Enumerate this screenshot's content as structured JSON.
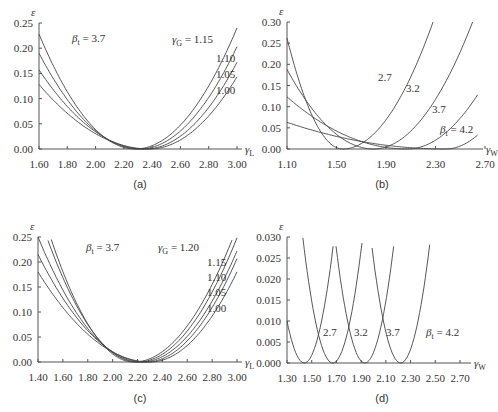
{
  "chart_data": [
    {
      "panel": "a",
      "caption": "(a)",
      "type": "line",
      "xlabel": "γL",
      "ylabel": "ε",
      "xlim": [
        1.6,
        3.0
      ],
      "ylim": [
        0.0,
        0.25
      ],
      "xticks": [
        "1.60",
        "1.80",
        "2.00",
        "2.20",
        "2.40",
        "2.60",
        "2.80",
        "3.00"
      ],
      "yticks": [
        "0.00",
        "0.05",
        "0.10",
        "0.15",
        "0.20",
        "0.25"
      ],
      "annotations": [
        "βt = 3.7",
        "γG = 1.15",
        "1.10",
        "1.05",
        "1.00"
      ],
      "series": [
        {
          "name": "γG = 1.15",
          "min_x": 2.28,
          "y_at_xmin": 0.228,
          "y_at_xmax": 0.24
        },
        {
          "name": "γG = 1.10",
          "min_x": 2.31,
          "y_at_xmin": 0.19,
          "y_at_xmax": 0.203
        },
        {
          "name": "γG = 1.05",
          "min_x": 2.35,
          "y_at_xmin": 0.157,
          "y_at_xmax": 0.172
        },
        {
          "name": "γG = 1.00",
          "min_x": 2.38,
          "y_at_xmin": 0.128,
          "y_at_xmax": 0.143
        }
      ]
    },
    {
      "panel": "b",
      "caption": "(b)",
      "type": "line",
      "xlabel": "γW",
      "ylabel": "ε",
      "xlim": [
        1.1,
        2.7
      ],
      "ylim": [
        0.0,
        0.3
      ],
      "xticks": [
        "1.10",
        "1.50",
        "1.90",
        "2.30",
        "2.70"
      ],
      "yticks": [
        "0.00",
        "0.05",
        "0.10",
        "0.15",
        "0.20",
        "0.25",
        "0.30"
      ],
      "annotations": [
        "2.7",
        "3.2",
        "3.7",
        "βt = 4.2"
      ],
      "series": [
        {
          "name": "βt = 2.7",
          "min_x": 1.55,
          "y_at_1.10": 0.262,
          "end_x": 2.28,
          "end_y": 0.3
        },
        {
          "name": "βt = 3.2",
          "min_x": 1.8,
          "y_at_1.10": 0.188,
          "end_x": 2.6,
          "end_y": 0.3
        },
        {
          "name": "βt = 3.7",
          "min_x": 2.07,
          "y_at_1.10": 0.123,
          "end_x": 2.64,
          "end_y": 0.128
        },
        {
          "name": "βt = 4.2",
          "min_x": 2.38,
          "y_at_1.10": 0.063,
          "end_x": 2.64,
          "end_y": 0.033
        }
      ]
    },
    {
      "panel": "c",
      "caption": "(c)",
      "type": "line",
      "xlabel": "γL",
      "ylabel": "ε",
      "xlim": [
        1.4,
        3.0
      ],
      "ylim": [
        0.0,
        0.25
      ],
      "xticks": [
        "1.40",
        "1.60",
        "1.80",
        "2.00",
        "2.20",
        "2.40",
        "2.60",
        "2.80",
        "3.00"
      ],
      "yticks": [
        "0.00",
        "0.05",
        "0.10",
        "0.15",
        "0.20",
        "0.25"
      ],
      "annotations": [
        "βt = 3.7",
        "γG = 1.20",
        "1.15",
        "1.10",
        "1.05",
        "1.00"
      ],
      "series": [
        {
          "name": "γG = 1.20",
          "min_x": 2.17
        },
        {
          "name": "γG = 1.15",
          "min_x": 2.2
        },
        {
          "name": "γG = 1.10",
          "min_x": 2.23
        },
        {
          "name": "γG = 1.05",
          "min_x": 2.27
        },
        {
          "name": "γG = 1.00",
          "min_x": 2.3
        }
      ]
    },
    {
      "panel": "d",
      "caption": "(d)",
      "type": "line",
      "xlabel": "γW",
      "ylabel": "ε",
      "xlim": [
        1.3,
        2.7
      ],
      "ylim": [
        0.0,
        0.03
      ],
      "xticks": [
        "1.30",
        "1.50",
        "1.70",
        "1.90",
        "2.10",
        "2.30",
        "2.50",
        "2.70"
      ],
      "yticks": [
        "0.000",
        "0.005",
        "0.010",
        "0.015",
        "0.020",
        "0.025",
        "0.030"
      ],
      "annotations": [
        "2.7",
        "3.2",
        "3.7",
        "βt = 4.2"
      ],
      "series": [
        {
          "name": "βt = 2.7",
          "min_x": 1.44
        },
        {
          "name": "βt = 3.2",
          "min_x": 1.67
        },
        {
          "name": "βt = 3.7",
          "min_x": 1.93
        },
        {
          "name": "βt = 4.2",
          "min_x": 2.22
        }
      ]
    }
  ],
  "panels": {
    "a": {
      "caption": "(a)",
      "beta": "= 3.7",
      "gamma_g_label": "= 1.15",
      "curve_labels": [
        "1.10",
        "1.05",
        "1.00"
      ]
    },
    "b": {
      "caption": "(b)",
      "curve_labels": [
        "2.7",
        "3.2",
        "3.7"
      ],
      "beta": "= 4.2"
    },
    "c": {
      "caption": "(c)",
      "beta": "= 3.7",
      "gamma_g_label": "= 1.20",
      "curve_labels": [
        "1.15",
        "1.10",
        "1.05",
        "1.00"
      ]
    },
    "d": {
      "caption": "(d)",
      "curve_labels": [
        "2.7",
        "3.2",
        "3.7"
      ],
      "beta": "= 4.2"
    }
  },
  "symbols": {
    "epsilon": "ε",
    "gamma": "γ",
    "beta": "β",
    "sub_L": "L",
    "sub_W": "W",
    "sub_G": "G",
    "sub_t": "t"
  }
}
